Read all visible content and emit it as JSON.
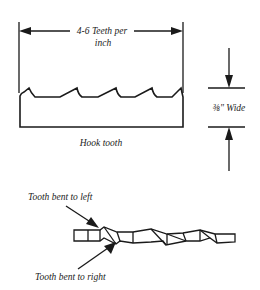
{
  "diagram": {
    "labels": {
      "teeth_per_inch_line1": "4-6 Teeth per",
      "teeth_per_inch_line2": "inch",
      "width": "⅜\" Wide",
      "tooth_type": "Hook tooth",
      "bent_left": "Tooth bent to left",
      "bent_right": "Tooth bent to right"
    },
    "colors": {
      "line": "#1a1a1a",
      "background": "#ffffff"
    }
  }
}
